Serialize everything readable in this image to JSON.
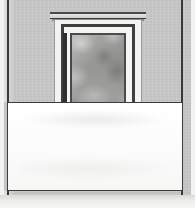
{
  "image": {
    "title": "Architectural doorway with overlaid blank white panel",
    "type": "photograph-illustration",
    "width_px": 195,
    "height_px": 208,
    "alt_text": "Grey rendered wall with a recessed moulded doorway; a large blank white rectangle covers the lower half of the frame."
  },
  "scene": {
    "background_label": "photo-margin",
    "wall_label": "rendered grey wall",
    "wall_color": "#c9c9c9",
    "photo_margin_color": "#f2f2f0",
    "edge_line_color": "#3a3a3a",
    "bottom_strip_label": "lower light strip"
  },
  "doorway": {
    "label": "moulded doorway surround",
    "parts": [
      {
        "name": "lintel-cap",
        "label": "projecting lintel cap",
        "color": "#4a4a4a"
      },
      {
        "name": "lintel-face",
        "label": "lintel face moulding",
        "color": "#e6e6e4"
      },
      {
        "name": "casing-outer",
        "label": "outer pale architrave",
        "color": "#f3f3f1"
      },
      {
        "name": "reveal-dark",
        "label": "dark reveal band",
        "color": "#3f3f3f"
      },
      {
        "name": "band-white",
        "label": "inner white band",
        "color": "#f5f5f3"
      },
      {
        "name": "frame-inner",
        "label": "inner dark frame",
        "color": "#4b4b4b"
      },
      {
        "name": "panel",
        "label": "mottled grey panel",
        "color": "#9d9d9c"
      },
      {
        "name": "stile-left",
        "label": "dark left stile",
        "color": "#2f2f2f"
      }
    ]
  },
  "overlay": {
    "label": "blank white rectangle overlay",
    "text": "",
    "fill_color": "#fdfdfd",
    "border_color": "#3c3c3c",
    "border_width_px": 1
  }
}
